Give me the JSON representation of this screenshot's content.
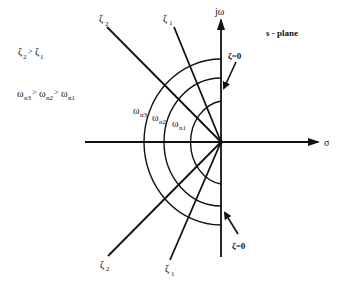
{
  "diagram": {
    "title": "s - plane",
    "axes": {
      "horizontal_label": "σ",
      "vertical_label": "jω"
    },
    "legend": {
      "zeta_relation": {
        "a": "ζ",
        "a_sub": "2",
        "op": ">",
        "b": "ζ",
        "b_sub": "1"
      },
      "omega_relation": {
        "a": "ω",
        "a_sub": "n3",
        "op1": ">",
        "b": "ω",
        "b_sub": "n2",
        "op2": ">",
        "c": "ω",
        "c_sub": "n1"
      }
    },
    "damping_lines": [
      {
        "name": "zeta-2-upper",
        "symbol": "ζ",
        "sub": "2"
      },
      {
        "name": "zeta-1-upper",
        "symbol": "ζ",
        "sub": "1"
      },
      {
        "name": "zeta-2-lower",
        "symbol": "ζ",
        "sub": "2"
      },
      {
        "name": "zeta-1-lower",
        "symbol": "ζ",
        "sub": "1"
      }
    ],
    "zeta_zero_labels": {
      "upper": "ζ=0",
      "lower": "ζ=0"
    },
    "frequency_arcs": [
      {
        "symbol": "ω",
        "sub": "n3"
      },
      {
        "symbol": "ω",
        "sub": "n2"
      },
      {
        "symbol": "ω",
        "sub": "n1"
      }
    ]
  }
}
